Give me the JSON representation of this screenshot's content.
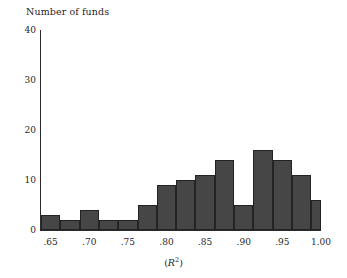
{
  "chart_data": {
    "type": "bar",
    "title": "Number of funds",
    "subtitle": "",
    "xlabel": "(R2)",
    "xlabel_display": "(R²)",
    "ylabel": "Number of funds",
    "grid": false,
    "legend": null,
    "xlim": [
      0.6375,
      1.0
    ],
    "ylim": [
      0,
      40
    ],
    "bin_width": 0.025,
    "x_tick_labels": [
      ".65",
      ".70",
      ".75",
      ".80",
      ".85",
      ".90",
      ".95",
      "1.00"
    ],
    "x_tick_values": [
      0.65,
      0.7,
      0.75,
      0.8,
      0.85,
      0.9,
      0.95,
      1.0
    ],
    "y_tick_labels": [
      "0",
      "10",
      "20",
      "30",
      "40"
    ],
    "y_tick_values": [
      0,
      10,
      20,
      30,
      40
    ],
    "categories": [
      "0.6375-0.6625",
      "0.6625-0.6875",
      "0.6875-0.7125",
      "0.7125-0.7375",
      "0.7375-0.7625",
      "0.7625-0.7875",
      "0.7875-0.8125",
      "0.8125-0.8375",
      "0.8375-0.8625",
      "0.8625-0.8875",
      "0.8875-0.9125",
      "0.9125-0.9375",
      "0.9375-0.9625",
      "0.9625-0.9875",
      "0.9875-1.0125"
    ],
    "bin_starts": [
      0.6375,
      0.6625,
      0.6875,
      0.7125,
      0.7375,
      0.7625,
      0.7875,
      0.8125,
      0.8375,
      0.8625,
      0.8875,
      0.9125,
      0.9375,
      0.9625,
      0.9875
    ],
    "values": [
      3,
      2,
      4,
      2,
      2,
      5,
      9,
      10,
      11,
      14,
      5,
      16,
      14,
      11,
      6
    ],
    "bar_color": "#464646",
    "bar_edge_color": "#232323",
    "axis_color": "#2b2b2b",
    "background_color": "#ffffff"
  }
}
